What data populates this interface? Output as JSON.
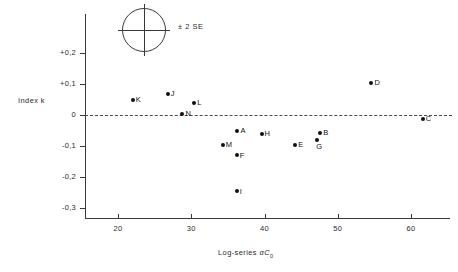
{
  "chart_data": {
    "type": "scatter",
    "title": "",
    "xlabel": "Log-series αC₀",
    "ylabel": "Index k",
    "xlim": [
      15,
      64
    ],
    "ylim": [
      -0.33,
      0.27
    ],
    "grid": false,
    "zero_line": 0,
    "xticks": [
      20,
      30,
      40,
      50,
      60
    ],
    "xtick_labels": [
      "20",
      "30",
      "40",
      "50",
      "60"
    ],
    "yticks": [
      0.2,
      0.1,
      0,
      -0.1,
      -0.2,
      -0.3
    ],
    "ytick_labels": [
      "+0,2",
      "+0,1",
      "0",
      "-0,1",
      "-0,2",
      "-0,3"
    ],
    "points": [
      {
        "label": "K",
        "x": 22.0,
        "y": 0.05
      },
      {
        "label": "J",
        "x": 26.8,
        "y": 0.068
      },
      {
        "label": "N",
        "x": 28.8,
        "y": 0.003
      },
      {
        "label": "L",
        "x": 30.4,
        "y": 0.04
      },
      {
        "label": "M",
        "x": 34.3,
        "y": -0.098
      },
      {
        "label": "A",
        "x": 36.3,
        "y": -0.052
      },
      {
        "label": "F",
        "x": 36.2,
        "y": -0.128
      },
      {
        "label": "I",
        "x": 36.2,
        "y": -0.245
      },
      {
        "label": "H",
        "x": 39.6,
        "y": -0.06
      },
      {
        "label": "E",
        "x": 44.2,
        "y": -0.098
      },
      {
        "label": "G",
        "x": 47.2,
        "y": -0.08
      },
      {
        "label": "B",
        "x": 47.6,
        "y": -0.058
      },
      {
        "label": "D",
        "x": 54.6,
        "y": 0.102
      },
      {
        "label": "C",
        "x": 61.6,
        "y": -0.012
      }
    ]
  },
  "legend": {
    "error_label": "± 2 SE",
    "shape": "circle-with-crosshair"
  }
}
